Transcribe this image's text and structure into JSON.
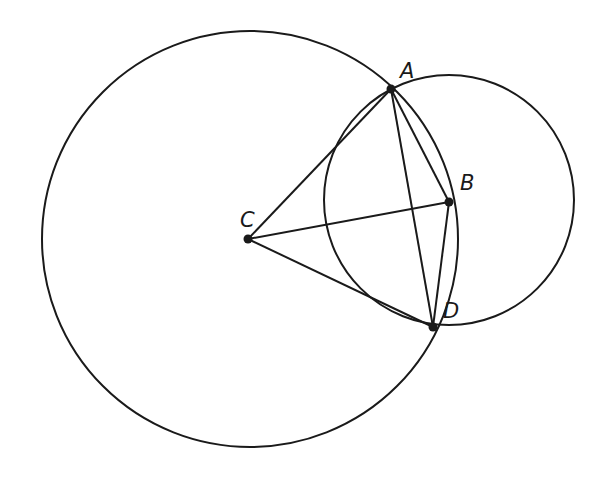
{
  "diagram": {
    "stroke_color": "#1a1a1a",
    "background": "#ffffff",
    "circles": [
      {
        "name": "large-circle",
        "center": "C",
        "cx": 250,
        "cy": 239,
        "r": 208
      },
      {
        "name": "small-circle",
        "center": "B",
        "cx": 449,
        "cy": 200,
        "r": 125
      }
    ],
    "points": [
      {
        "label": "A",
        "x": 391,
        "y": 89,
        "lx": 400,
        "ly": 78
      },
      {
        "label": "B",
        "x": 449,
        "y": 202,
        "lx": 460,
        "ly": 190
      },
      {
        "label": "C",
        "x": 248,
        "y": 239,
        "lx": 240,
        "ly": 227
      },
      {
        "label": "D",
        "x": 433,
        "y": 327,
        "lx": 443,
        "ly": 318
      }
    ],
    "segments": [
      [
        "C",
        "A"
      ],
      [
        "C",
        "B"
      ],
      [
        "C",
        "D"
      ],
      [
        "A",
        "B"
      ],
      [
        "A",
        "D"
      ],
      [
        "B",
        "D"
      ]
    ]
  }
}
